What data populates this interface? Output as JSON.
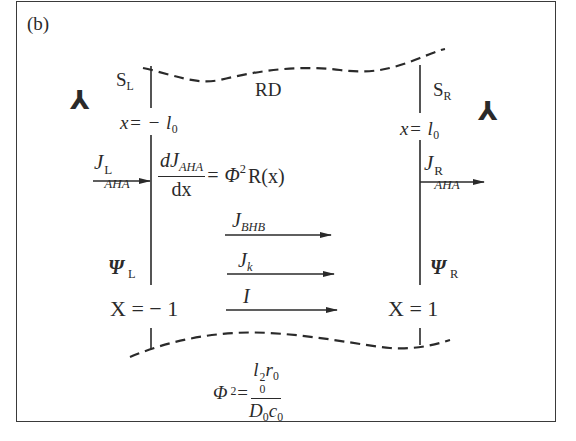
{
  "figure": {
    "panel_label": "(b)",
    "region_label": "RD",
    "left_boundary": {
      "surface": "S",
      "surface_sub": "L",
      "position_var": "x",
      "position_value": "= − l",
      "position_value_sub": "0",
      "flux": "J",
      "flux_sup": "L",
      "flux_sub": "AHA",
      "potential": "Ψ",
      "potential_sub": "L",
      "dimensionless_pos": "X = − 1"
    },
    "right_boundary": {
      "surface": "S",
      "surface_sub": "R",
      "position_var": "x",
      "position_value": "= l",
      "position_value_sub": "0",
      "flux": "J",
      "flux_sup": "R",
      "flux_sub": "AHA",
      "potential": "Ψ",
      "potential_sub": "R",
      "dimensionless_pos": "X = 1"
    },
    "reaction_equation": {
      "num_main": "dJ",
      "num_sub": "AHA",
      "den": "dx",
      "rhs": "= Φ",
      "rhs_sup": "2",
      "rhs_tail": "R(x)"
    },
    "fluxes": [
      {
        "symbol": "J",
        "sub": "BHB"
      },
      {
        "symbol": "J",
        "sub": "k"
      },
      {
        "symbol": "I",
        "sub": ""
      }
    ],
    "thiele_modulus": {
      "lhs": "Φ",
      "lhs_sup": "2",
      "eq": "=",
      "num_l": "l",
      "num_l_sub": "0",
      "num_l_sup": "2",
      "num_r": "r",
      "num_r_sub": "0",
      "den_D": "D",
      "den_D_sub": "0",
      "den_c": "c",
      "den_c_sub": "0"
    },
    "electrode_symbol": "⅄",
    "colors": {
      "ink": "#2a2a2a",
      "background": "#ffffff"
    }
  }
}
